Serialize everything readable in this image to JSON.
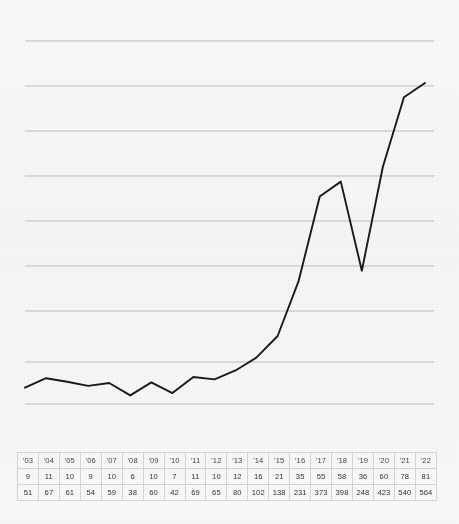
{
  "chart_data": {
    "type": "line",
    "title": "",
    "subtitle": "",
    "xlabel": "",
    "ylabel": "",
    "grid": true,
    "legend_position": "none",
    "gridline_count": 9,
    "axis_note": "unlabeled horizontal gridlines; no numeric axis ticks shown",
    "categories": [
      "'03",
      "'04",
      "'05",
      "'06",
      "'07",
      "'08",
      "'09",
      "'10",
      "'11",
      "'12",
      "'13",
      "'14",
      "'15",
      "'16",
      "'17",
      "'18",
      "'19",
      "'20",
      "'21",
      "'22"
    ],
    "plotted_series": "series_b",
    "ylim": [
      0,
      600
    ],
    "series": [
      {
        "name": "series_a",
        "values": [
          9,
          11,
          10,
          9,
          10,
          6,
          10,
          7,
          11,
          10,
          12,
          16,
          21,
          35,
          55,
          58,
          36,
          60,
          78,
          81
        ]
      },
      {
        "name": "series_b",
        "values": [
          51,
          67,
          61,
          54,
          59,
          38,
          60,
          42,
          69,
          65,
          80,
          102,
          138,
          231,
          373,
          398,
          248,
          423,
          540,
          564
        ]
      }
    ]
  },
  "table": {
    "rows": [
      {
        "name": "years",
        "cells": [
          "'03",
          "'04",
          "'05",
          "'06",
          "'07",
          "'08",
          "'09",
          "'10",
          "'11",
          "'12",
          "'13",
          "'14",
          "'15",
          "'16",
          "'17",
          "'18",
          "'19",
          "'20",
          "'21",
          "'22"
        ]
      },
      {
        "name": "series-a",
        "cells": [
          "9",
          "11",
          "10",
          "9",
          "10",
          "6",
          "10",
          "7",
          "11",
          "10",
          "12",
          "16",
          "21",
          "35",
          "55",
          "58",
          "36",
          "60",
          "78",
          "81"
        ]
      },
      {
        "name": "series-b",
        "cells": [
          "51",
          "67",
          "61",
          "54",
          "59",
          "38",
          "60",
          "42",
          "69",
          "65",
          "80",
          "102",
          "138",
          "231",
          "373",
          "398",
          "248",
          "423",
          "540",
          "564"
        ]
      }
    ]
  },
  "style": {
    "line_color": "#1a1a1a",
    "gridline_color": "#b6b6b4",
    "background_color": "#fbfbfa",
    "table_border_color": "#d3d3d1",
    "text_color": "#3a3a3a"
  }
}
